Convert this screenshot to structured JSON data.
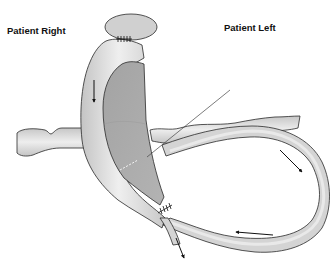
{
  "diagram": {
    "type": "anatomical-vascular-schematic",
    "labels": {
      "patient_right": "Patient Right",
      "patient_left": "Patient Left"
    },
    "colors": {
      "vessel_fill": "#d6d6d6",
      "vessel_highlight": "#ececec",
      "chamber_fill": "#a9a9a9",
      "outline": "#2a2a2a",
      "ellipse_fill": "#d0d0d0",
      "background": "#ffffff"
    },
    "elements": [
      {
        "name": "top-ellipse-vessel",
        "description": "oval vessel cross-section at top with suture marks"
      },
      {
        "name": "descending-vessel",
        "description": "curved vessel descending from top, downward flow arrow"
      },
      {
        "name": "dark-chamber",
        "description": "shaded dark gray chamber region within curved vessel"
      },
      {
        "name": "horizontal-left-vessel",
        "description": "wavy horizontal vessel extending to patient right"
      },
      {
        "name": "horizontal-right-vessel",
        "description": "wavy horizontal vessel extending to patient left"
      },
      {
        "name": "loop-vessel",
        "description": "large loop vessel on patient left with circulating flow arrows"
      },
      {
        "name": "needle-line",
        "description": "diagonal thin line crossing into chamber"
      },
      {
        "name": "bottom-outflow-vessel",
        "description": "outflow vessel exiting downward with arrow, suture marks at junction"
      }
    ],
    "arrows": [
      {
        "location": "descending-vessel",
        "direction": "down"
      },
      {
        "location": "loop-right-side",
        "direction": "down-right"
      },
      {
        "location": "loop-bottom",
        "direction": "left"
      },
      {
        "location": "bottom-outflow",
        "direction": "down"
      }
    ]
  }
}
